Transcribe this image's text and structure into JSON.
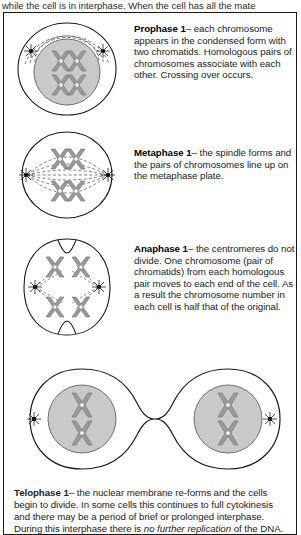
{
  "page": {
    "clipped_top_line": "while the cell is in interphase. When the cell has all the mate",
    "figure_title": "meiosis-1-stages-diagram"
  },
  "stages": [
    {
      "id": "prophase-1",
      "name": "Prophase 1",
      "dash": "–",
      "body": "each chromosome appears in the condensed form with two chromatids. Homologous pairs of chromosomes associate with each other. Crossing over occurs.",
      "art_name": "prophase-1-cell-illustration",
      "chromosome_count": 4,
      "centrosome_count": 2,
      "has_nucleus": true
    },
    {
      "id": "metaphase-1",
      "name": "Metaphase 1",
      "dash": "–",
      "body": "the spindle forms and the pairs of chromosomes line up on the metaphase plate.",
      "art_name": "metaphase-1-cell-illustration",
      "chromosome_count": 4,
      "centrosome_count": 2,
      "has_nucleus": false
    },
    {
      "id": "anaphase-1",
      "name": "Anaphase 1",
      "dash": "–",
      "body": "the centromeres do not divide. One chromosome (pair of chromatids) from each homologous pair moves to each end of the cell. As a result the chromosome number in each cell is half that of the original.",
      "art_name": "anaphase-1-cell-illustration",
      "chromosome_count": 4,
      "centrosome_count": 2,
      "has_nucleus": false
    }
  ],
  "telophase": {
    "id": "telophase-1",
    "name": "Telophase 1",
    "dash": "–",
    "body_part1": "the nuclear membrane re-forms and the cells begin to divide. In some cells this continues to full cytokinesis and there may be a period of brief or prolonged interphase. During this interphase there is ",
    "body_italic": "no further replication",
    "body_part2": " of the DNA.",
    "art_name": "telophase-1-two-daughter-cells-illustration",
    "daughter_cells": 2,
    "chromosomes_per_cell": 2
  },
  "colors": {
    "outline": "#1a1a1a",
    "nucleus_fill": "#c9c9c9",
    "chromosome_fill": "#9a9a9a",
    "chromosome_stroke": "#6e6e6e",
    "spindle": "#555555",
    "text": "#222222",
    "background": "#ffffff"
  }
}
